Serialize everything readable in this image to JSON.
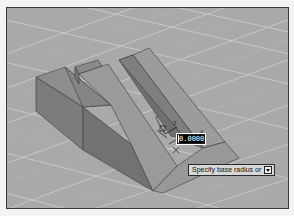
{
  "viewport": {
    "background_color": "#a8a8a8",
    "grid_color": "#d6d6d6",
    "solid_colors": {
      "top_face": "#8f8f8f",
      "front_face": "#7a7a7a",
      "slope_face": "#9a9a9a",
      "dark_face": "#6e6e6e"
    }
  },
  "cursor": {
    "crosshair_label_z": "Z",
    "crosshair_label_y": "Y",
    "crosshair_label_x": "X"
  },
  "dynamic_input": {
    "value": "0.0000"
  },
  "command_prompt": {
    "text": "Specify base radius or",
    "options_icon": "down-arrow-key-icon"
  }
}
